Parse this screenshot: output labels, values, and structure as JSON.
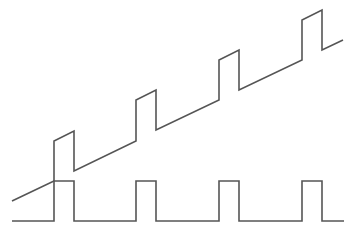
{
  "diagram": {
    "type": "waveform",
    "stroke_color": "#555555",
    "background": "#ffffff",
    "signals": [
      {
        "name": "sawtooth-with-pulses",
        "points": [
          [
            12,
            201
          ],
          [
            54,
            181
          ],
          [
            54,
            141
          ],
          [
            74,
            131
          ],
          [
            74,
            171
          ],
          [
            136,
            141
          ],
          [
            136,
            100
          ],
          [
            156,
            90
          ],
          [
            156,
            130
          ],
          [
            219,
            100
          ],
          [
            219,
            60
          ],
          [
            239,
            50
          ],
          [
            239,
            90
          ],
          [
            302,
            60
          ],
          [
            302,
            20
          ],
          [
            322,
            10
          ],
          [
            322,
            50
          ],
          [
            343,
            40
          ]
        ]
      },
      {
        "name": "pulse-train",
        "points": [
          [
            12,
            221
          ],
          [
            54,
            221
          ],
          [
            54,
            181
          ],
          [
            74,
            181
          ],
          [
            74,
            221
          ],
          [
            136,
            221
          ],
          [
            136,
            181
          ],
          [
            156,
            181
          ],
          [
            156,
            221
          ],
          [
            219,
            221
          ],
          [
            219,
            181
          ],
          [
            239,
            181
          ],
          [
            239,
            221
          ],
          [
            302,
            221
          ],
          [
            302,
            181
          ],
          [
            322,
            181
          ],
          [
            322,
            221
          ],
          [
            344,
            221
          ]
        ]
      }
    ]
  }
}
